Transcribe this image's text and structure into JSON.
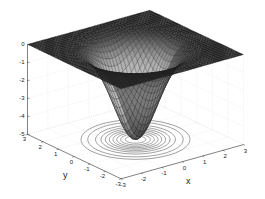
{
  "chart_data": {
    "type": "surface3d",
    "title": "",
    "function": "z = -5 * exp(-(x^2 + y^2)/1.5)",
    "xlabel": "x",
    "ylabel": "y",
    "zlabel": "",
    "xlim": [
      -3,
      3
    ],
    "ylim": [
      -3,
      3
    ],
    "zlim": [
      -5,
      0
    ],
    "xticks": [
      -3,
      -2,
      -1,
      0,
      1,
      2,
      3
    ],
    "yticks": [
      -3,
      -2,
      -1,
      0,
      1,
      2,
      3
    ],
    "zticks": [
      0,
      -1,
      -2,
      -3,
      -4,
      -5
    ],
    "grid": true,
    "contour_on_floor": true,
    "contour_levels": [
      -0.25,
      -0.5,
      -1.0,
      -1.5,
      -2.0,
      -2.5,
      -3.0,
      -3.5,
      -4.0,
      -4.5
    ],
    "min_point": {
      "x": 0,
      "y": 0,
      "z": -5
    },
    "mesh_resolution": 40,
    "colormap": "gray (dark edges, lighter facets near well)"
  },
  "labels": {
    "x": "x",
    "y": "y"
  }
}
